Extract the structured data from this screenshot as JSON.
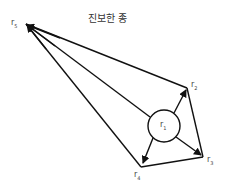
{
  "title": "진보한 종",
  "nodes": {
    "r1": {
      "label": "r",
      "sub": "1"
    },
    "r2": {
      "label": "r",
      "sub": "2"
    },
    "r3": {
      "label": "r",
      "sub": "3"
    },
    "r4": {
      "label": "r",
      "sub": "4"
    },
    "r5": {
      "label": "r",
      "sub": "5"
    }
  },
  "colors": {
    "stroke": "#111111",
    "background": "#ffffff"
  }
}
